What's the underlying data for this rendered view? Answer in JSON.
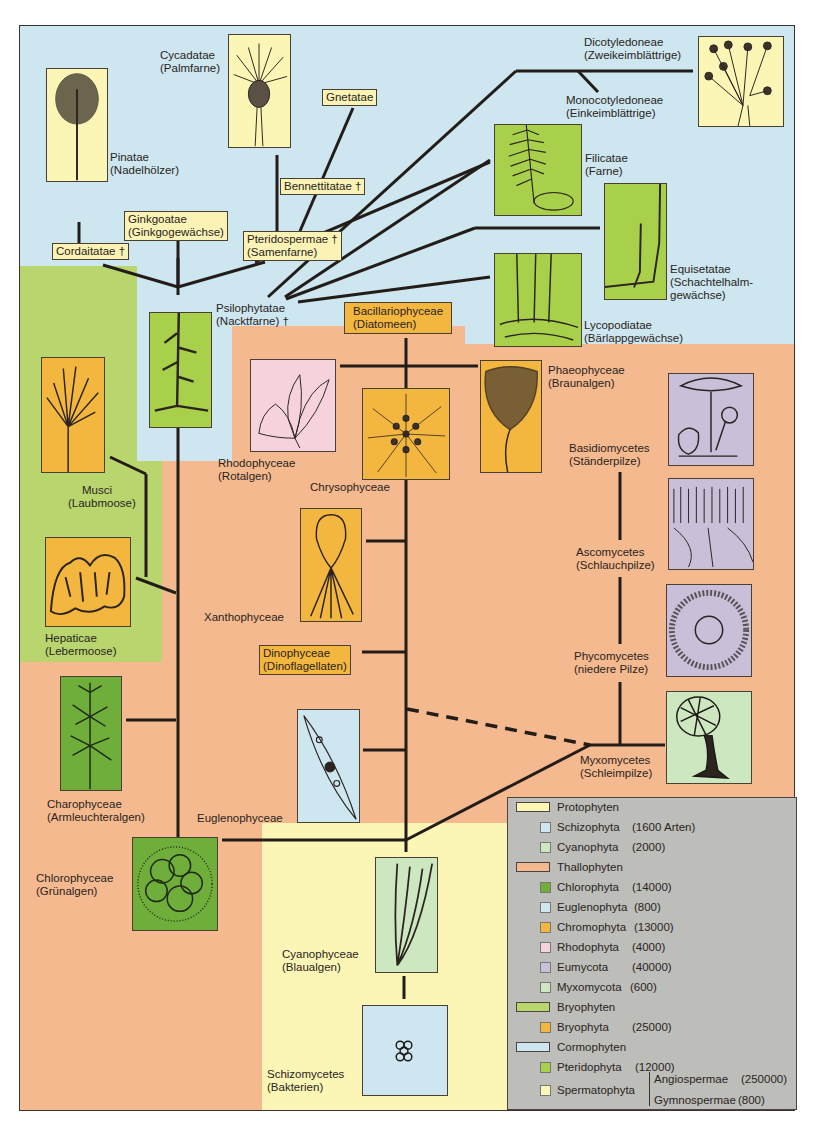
{
  "colors": {
    "cormophyten_bg": "#cde6ef",
    "bryophyten_bg": "#b9d56e",
    "thallophyten_bg": "#f4b98f",
    "protophyten_bg": "#fbf5b6",
    "legend_bg": "#bdbdb9",
    "line": "#231d1a"
  },
  "taxa": {
    "pinatae": {
      "name": "Pinatae",
      "common": "(Nadelhölzer)"
    },
    "cycadatae": {
      "name": "Cycadatae",
      "common": "(Palmfarne)"
    },
    "gnetatae": {
      "name": "Gnetatae"
    },
    "bennettitatae": {
      "name": "Bennettitatae †"
    },
    "ginkgoatae": {
      "name": "Ginkgoatae",
      "common": "(Ginkgogewächse)"
    },
    "cordaitatae": {
      "name": "Cordaitatae †"
    },
    "pteridospermae": {
      "name": "Pteridospermae †",
      "common": "(Samenfarne)"
    },
    "dicotyledoneae": {
      "name": "Dicotyledoneae",
      "common": "(Zweikeimblättrige)"
    },
    "monocotyledoneae": {
      "name": "Monocotyledoneae",
      "common": "(Einkeimblättrige)"
    },
    "filicatae": {
      "name": "Filicatae",
      "common": "(Farne)"
    },
    "equisetatae": {
      "name": "Equisetatae",
      "common1": "(Schachtelhalm-",
      "common2": "gewächse)"
    },
    "lycopodiatae": {
      "name": "Lycopodiatae",
      "common": "(Bärlappgewächse)"
    },
    "psilophytatae": {
      "name": "Psilophytatae",
      "common": "(Nacktfarne) †"
    },
    "bacillariophyceae": {
      "name": "Bacillariophyceae",
      "common": "(Diatomeen)"
    },
    "phaeophyceae": {
      "name": "Phaeophyceae",
      "common": "(Braunalgen)"
    },
    "rhodophyceae": {
      "name": "Rhodophyceae",
      "common": "(Rotalgen)"
    },
    "chrysophyceae": {
      "name": "Chrysophyceae"
    },
    "musci": {
      "name": "Musci",
      "common": "(Laubmoose)"
    },
    "hepaticae": {
      "name": "Hepaticae",
      "common": "(Lebermoose)"
    },
    "xanthophyceae": {
      "name": "Xanthophyceae"
    },
    "dinophyceae": {
      "name": "Dinophyceae",
      "common": "(Dinoflagellaten)"
    },
    "basidiomycetes": {
      "name": "Basidiomycetes",
      "common": "(Ständerpilze)"
    },
    "ascomycetes": {
      "name": "Ascomycetes",
      "common": "(Schlauchpilze)"
    },
    "phycomycetes": {
      "name": "Phycomycetes",
      "common": "(niedere Pilze)"
    },
    "myxomycetes": {
      "name": "Myxomycetes",
      "common": "(Schleimpilze)"
    },
    "charophyceae": {
      "name": "Charophyceae",
      "common": "(Armleuchteralgen)"
    },
    "euglenophyceae": {
      "name": "Euglenophyceae"
    },
    "chlorophyceae": {
      "name": "Chlorophyceae",
      "common": "(Grünalgen)"
    },
    "cyanophyceae": {
      "name": "Cyanophyceae",
      "common": "(Blaualgen)"
    },
    "schizomycetes": {
      "name": "Schizomycetes",
      "common": "(Bakterien)"
    }
  },
  "legend": {
    "items": [
      {
        "kind": "group",
        "label": "Protophyten",
        "color": "#fbf5b6"
      },
      {
        "kind": "item",
        "label": "Schizophyta",
        "count": "(1600 Arten)",
        "color": "#cde6ef"
      },
      {
        "kind": "item",
        "label": "Cyanophyta",
        "count": "(2000)",
        "color": "#cde8c0"
      },
      {
        "kind": "group",
        "label": "Thallophyten",
        "color": "#f4b98f"
      },
      {
        "kind": "item",
        "label": "Chlorophyta",
        "count": "(14000)",
        "color": "#6fae3a"
      },
      {
        "kind": "item",
        "label": "Euglenophyta",
        "count": "(800)",
        "color": "#cde6ef"
      },
      {
        "kind": "item",
        "label": "Chromophyta",
        "count": "(13000)",
        "color": "#f3b63e"
      },
      {
        "kind": "item",
        "label": "Rhodophyta",
        "count": "(4000)",
        "color": "#f6d3dc"
      },
      {
        "kind": "item",
        "label": "Eumycota",
        "count": "(40000)",
        "color": "#c9bfd9"
      },
      {
        "kind": "item",
        "label": "Myxomycota",
        "count": "(600)",
        "color": "#cde8c0"
      },
      {
        "kind": "group",
        "label": "Bryophyten",
        "color": "#b9d56e"
      },
      {
        "kind": "item",
        "label": "Bryophyta",
        "count": "(25000)",
        "color": "#f3b63e"
      },
      {
        "kind": "group",
        "label": "Cormophyten",
        "color": "#cde6ef"
      },
      {
        "kind": "item",
        "label": "Pteridophyta",
        "count": "(12000)",
        "color": "#a9d04a"
      },
      {
        "kind": "item",
        "label": "Spermatophyta",
        "count": "",
        "color": "#fbf5b6"
      }
    ],
    "spermatophyta_sub": [
      {
        "label": "Angiospermae",
        "count": "(250000)"
      },
      {
        "label": "Gymnospermae",
        "count": "(800)"
      }
    ]
  }
}
